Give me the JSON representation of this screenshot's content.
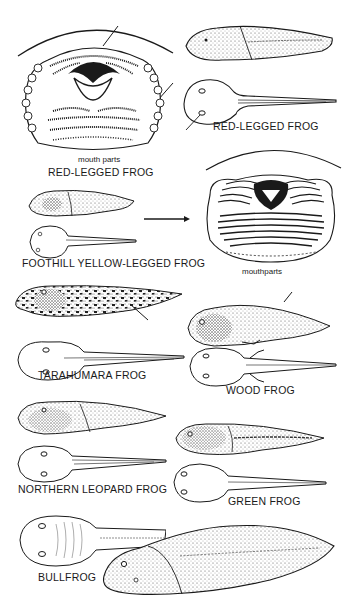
{
  "plate": {
    "colors": {
      "ink": "#1a1a1a",
      "stipple": "#7a7a7a",
      "background": "#ffffff"
    },
    "labels": {
      "mouth_parts_1": "mouth parts",
      "red_legged_1": "RED-LEGGED FROG",
      "red_legged_2": "RED-LEGGED FROG",
      "foothill": "FOOTHILL YELLOW-LEGGED FROG",
      "mouthparts_2": "mouthparts",
      "tarahumara": "TARAHUMARA FROG",
      "wood": "WOOD FROG",
      "northern_leopard": "NORTHERN LEOPARD FROG",
      "green": "GREEN FROG",
      "bullfrog": "BULLFROG"
    }
  }
}
